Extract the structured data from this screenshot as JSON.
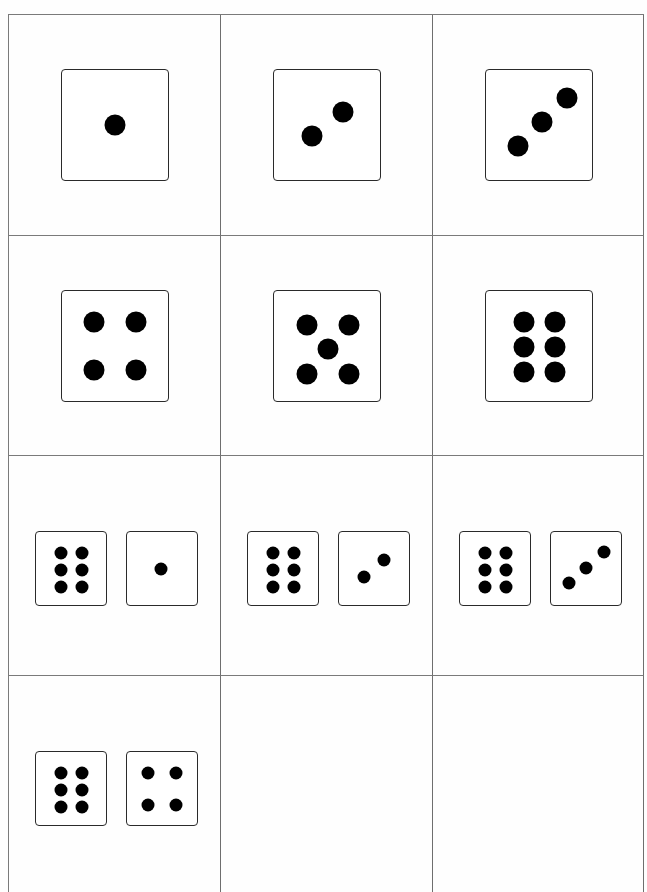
{
  "sheet": {
    "title": "Dice cards",
    "grid": {
      "columns": 3,
      "rows": 4,
      "line_color": "#7a7a7a"
    },
    "cards": [
      {
        "id": "card-1",
        "dice": [
          1
        ],
        "total": 1
      },
      {
        "id": "card-2",
        "dice": [
          2
        ],
        "total": 2
      },
      {
        "id": "card-3",
        "dice": [
          3
        ],
        "total": 3
      },
      {
        "id": "card-4",
        "dice": [
          4
        ],
        "total": 4
      },
      {
        "id": "card-5",
        "dice": [
          5
        ],
        "total": 5
      },
      {
        "id": "card-6",
        "dice": [
          6
        ],
        "total": 6
      },
      {
        "id": "card-7",
        "dice": [
          6,
          1
        ],
        "total": 7
      },
      {
        "id": "card-8",
        "dice": [
          6,
          2
        ],
        "total": 8
      },
      {
        "id": "card-9",
        "dice": [
          6,
          3
        ],
        "total": 9
      },
      {
        "id": "card-10",
        "dice": [
          6,
          4
        ],
        "total": 10
      },
      {
        "id": "card-11",
        "dice": [],
        "total": null
      },
      {
        "id": "card-12",
        "dice": [],
        "total": null
      }
    ]
  },
  "colors": {
    "pip": "#000000",
    "die_border": "#2a2a2a",
    "background": "#fefefe"
  }
}
